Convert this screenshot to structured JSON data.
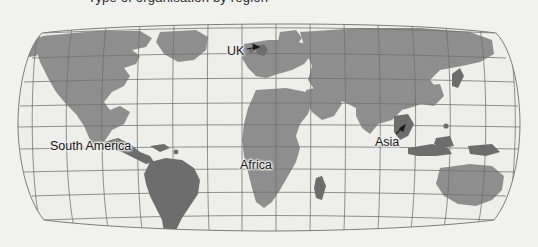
{
  "page": {
    "background_color": "#f1f1ef",
    "cut_off_caption": "Type of organisation by region"
  },
  "map": {
    "name": "world-map",
    "projection": "robinson",
    "graticule": {
      "visible": true,
      "line_color": "#6f6f6f",
      "meridian_spacing_degrees": 15,
      "parallel_spacing_degrees": 15
    },
    "colors": {
      "ocean": "#eeeeec",
      "land": "#8e8e8e",
      "land_dark": "#6d6d6d",
      "outline": "#6f6f6f",
      "label_text": "#191919"
    },
    "labels": [
      {
        "id": "uk",
        "text": "UK",
        "has_leader": true,
        "leader_direction": "right"
      },
      {
        "id": "south-america",
        "text": "South America",
        "has_leader": false,
        "leader_direction": ""
      },
      {
        "id": "africa",
        "text": "Africa",
        "has_leader": false,
        "leader_direction": ""
      },
      {
        "id": "asia",
        "text": "Asia",
        "has_leader": true,
        "leader_direction": "up-right"
      }
    ]
  }
}
